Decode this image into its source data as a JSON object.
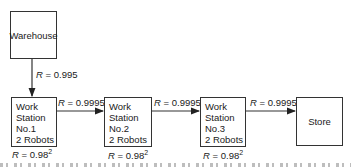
{
  "nodes": {
    "warehouse": {
      "label": "Warehouse"
    },
    "station1": {
      "lines": [
        "Work",
        "Station",
        "No.1",
        "2 Robots"
      ],
      "reliability_base": "0.98",
      "reliability_exp": "2"
    },
    "station2": {
      "lines": [
        "Work",
        "Station",
        "No.2",
        "2 Robots"
      ],
      "reliability_base": "0.98",
      "reliability_exp": "2"
    },
    "station3": {
      "lines": [
        "Work",
        "Station",
        "No.3",
        "2 Robots"
      ],
      "reliability_base": "0.98",
      "reliability_exp": "2"
    },
    "store": {
      "label": "Store"
    }
  },
  "edges": [
    {
      "from": "warehouse",
      "to": "station1",
      "symbol": "R",
      "value": "= 0.995"
    },
    {
      "from": "station1",
      "to": "station2",
      "symbol": "R",
      "value": "= 0.9995"
    },
    {
      "from": "station2",
      "to": "station3",
      "symbol": "R",
      "value": "= 0.9995"
    },
    {
      "from": "station3",
      "to": "store",
      "symbol": "R",
      "value": "= 0.9995"
    }
  ],
  "colors": {
    "line": "#333333",
    "text": "#1a1a1a"
  }
}
